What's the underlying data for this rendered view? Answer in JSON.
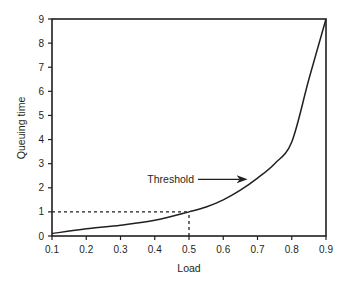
{
  "chart_data": {
    "type": "line",
    "title": "",
    "xlabel": "Load",
    "ylabel": "Queuing time",
    "xlim": [
      0.1,
      0.9
    ],
    "ylim": [
      0,
      9
    ],
    "x_ticks": [
      "0.1",
      "0.2",
      "0.3",
      "0.4",
      "0.5",
      "0.6",
      "0.7",
      "0.8",
      "0.9"
    ],
    "y_ticks": [
      "0",
      "1",
      "2",
      "3",
      "4",
      "5",
      "6",
      "7",
      "8",
      "9"
    ],
    "grid": false,
    "legend": null,
    "series": [
      {
        "name": "Queuing time",
        "x": [
          0.1,
          0.2,
          0.3,
          0.4,
          0.5,
          0.55,
          0.6,
          0.65,
          0.7,
          0.75,
          0.8,
          0.85,
          0.9
        ],
        "y": [
          0.1,
          0.3,
          0.45,
          0.65,
          1.0,
          1.2,
          1.5,
          1.9,
          2.4,
          3.0,
          3.9,
          6.5,
          9.0
        ]
      }
    ],
    "reference_lines": [
      {
        "type": "dashed",
        "from": [
          0.1,
          1.0
        ],
        "to": [
          0.5,
          1.0
        ]
      },
      {
        "type": "dashed",
        "from": [
          0.5,
          0.0
        ],
        "to": [
          0.5,
          1.0
        ]
      }
    ],
    "annotations": [
      {
        "text": "Threshold",
        "arrow_to": [
          0.68,
          2.35
        ]
      }
    ],
    "color": "#231f20"
  }
}
